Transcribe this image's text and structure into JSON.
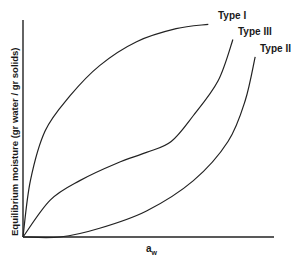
{
  "chart_data": {
    "type": "line",
    "title": "",
    "xlabel": "a_w",
    "xlabel_main": "a",
    "xlabel_sub": "w",
    "ylabel": "Equilibrium moisture (gr water / gr solids)",
    "grid": false,
    "legend": "inline labels at curve ends",
    "xlim": [
      0,
      1
    ],
    "ylim": [
      0,
      1
    ],
    "series": [
      {
        "name": "Type I",
        "x": [
          0.0,
          0.03,
          0.09,
          0.19,
          0.31,
          0.46,
          0.62,
          0.75
        ],
        "y": [
          0.0,
          0.26,
          0.49,
          0.65,
          0.79,
          0.9,
          0.96,
          0.98
        ]
      },
      {
        "name": "Type III",
        "x": [
          0.0,
          0.11,
          0.23,
          0.38,
          0.5,
          0.6,
          0.69,
          0.79,
          0.85
        ],
        "y": [
          0.0,
          0.17,
          0.26,
          0.34,
          0.39,
          0.44,
          0.56,
          0.72,
          0.91
        ]
      },
      {
        "name": "Type II",
        "x": [
          0.0,
          0.15,
          0.31,
          0.5,
          0.69,
          0.83,
          0.9,
          0.94
        ],
        "y": [
          0.0,
          0.0,
          0.04,
          0.12,
          0.26,
          0.44,
          0.63,
          0.83
        ]
      }
    ]
  },
  "labels": {
    "type1": "Type I",
    "type3": "Type III",
    "type2": "Type II",
    "ylabel": "Equilibrium moisture (gr water / gr solids)",
    "xlabel_main": "a",
    "xlabel_sub": "w"
  },
  "colors": {
    "line": "#222222",
    "background": "#ffffff"
  }
}
